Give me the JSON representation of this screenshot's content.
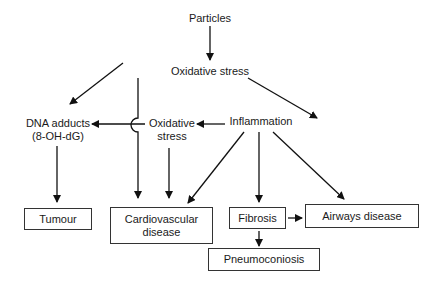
{
  "diagram": {
    "type": "flowchart",
    "nodes": {
      "particles": {
        "label": "Particles"
      },
      "oxidative_stress_top": {
        "label": "Oxidative stress"
      },
      "dna_adducts": {
        "line1": "DNA adducts",
        "line2": "(8-OH-dG)"
      },
      "oxidative_stress_mid": {
        "line1": "Oxidative",
        "line2": "stress"
      },
      "inflammation": {
        "label": "Inflammation"
      },
      "tumour": {
        "label": "Tumour"
      },
      "cardiovascular": {
        "line1": "Cardiovascular",
        "line2": "disease"
      },
      "fibrosis": {
        "label": "Fibrosis"
      },
      "airways": {
        "label": "Airways disease"
      },
      "pneumoconiosis": {
        "label": "Pneumoconiosis"
      }
    },
    "edges": [
      {
        "from": "Particles",
        "to": "Oxidative stress"
      },
      {
        "from": "Oxidative stress",
        "to": "DNA adducts (8-OH-dG)"
      },
      {
        "from": "Oxidative stress",
        "to": "Cardiovascular disease"
      },
      {
        "from": "Oxidative stress",
        "to": "Inflammation"
      },
      {
        "from": "Inflammation",
        "to": "Oxidative stress (mid)"
      },
      {
        "from": "Oxidative stress (mid)",
        "to": "DNA adducts (8-OH-dG)"
      },
      {
        "from": "Oxidative stress (mid)",
        "to": "Cardiovascular disease"
      },
      {
        "from": "DNA adducts (8-OH-dG)",
        "to": "Tumour"
      },
      {
        "from": "Inflammation",
        "to": "Cardiovascular disease"
      },
      {
        "from": "Inflammation",
        "to": "Fibrosis"
      },
      {
        "from": "Inflammation",
        "to": "Airways disease"
      },
      {
        "from": "Fibrosis",
        "to": "Airways disease"
      },
      {
        "from": "Fibrosis",
        "to": "Pneumoconiosis"
      }
    ]
  }
}
